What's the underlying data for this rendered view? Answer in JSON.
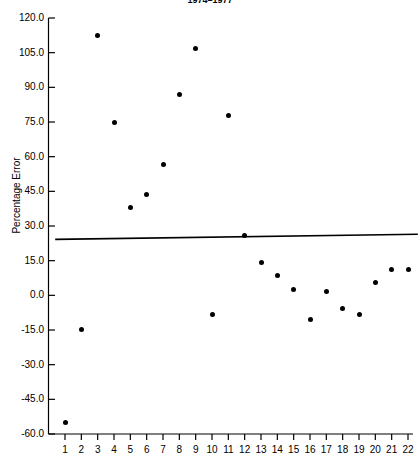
{
  "chart_data": {
    "type": "scatter",
    "title": "1974–1977",
    "xlabel": "",
    "ylabel": "Percentage Error",
    "xlim": [
      0.4,
      22.6
    ],
    "ylim": [
      -60.0,
      120.0
    ],
    "grid": false,
    "legend": null,
    "x": [
      1,
      2,
      3,
      4,
      5,
      6,
      7,
      8,
      9,
      10,
      11,
      12,
      13,
      14,
      15,
      16,
      17,
      18,
      19,
      20,
      21,
      22
    ],
    "values": [
      -55.2,
      -14.9,
      112.6,
      74.6,
      37.8,
      43.8,
      56.4,
      86.7,
      107.0,
      -8.5,
      78.0,
      26.1,
      14.4,
      8.4,
      2.4,
      -10.6,
      1.8,
      -5.5,
      -8.5,
      5.4,
      11.2,
      11.2
    ],
    "xticklabels": [
      "1",
      "2",
      "3",
      "4",
      "5",
      "6",
      "7",
      "8",
      "9",
      "10",
      "11",
      "12",
      "13",
      "14",
      "15",
      "16",
      "17",
      "18",
      "19",
      "20",
      "21",
      "22"
    ],
    "yticks": [
      120.0,
      105.0,
      90.0,
      75.0,
      60.0,
      45.0,
      30.0,
      15.0,
      0.0,
      -15.0,
      -30.0,
      -45.0,
      -60.0
    ],
    "yticklabels": [
      "120.0",
      "105.0",
      "90.0",
      "75.0",
      "60.0",
      "45.0",
      "30.0",
      "15.0",
      "0.0",
      "-15.0",
      "-30.0",
      "-45.0",
      "-60.0"
    ],
    "annotations": [
      {
        "name": "mean-reference-line",
        "type": "line",
        "x_start": 0.4,
        "x_end": 22.6,
        "y_start": 24.2,
        "y_end": 26.4
      }
    ],
    "marker": {
      "shape": "circle",
      "color": "#000000",
      "size": 5
    },
    "line_color": "#000000",
    "axis_color": "#000000",
    "background": "#ffffff"
  }
}
